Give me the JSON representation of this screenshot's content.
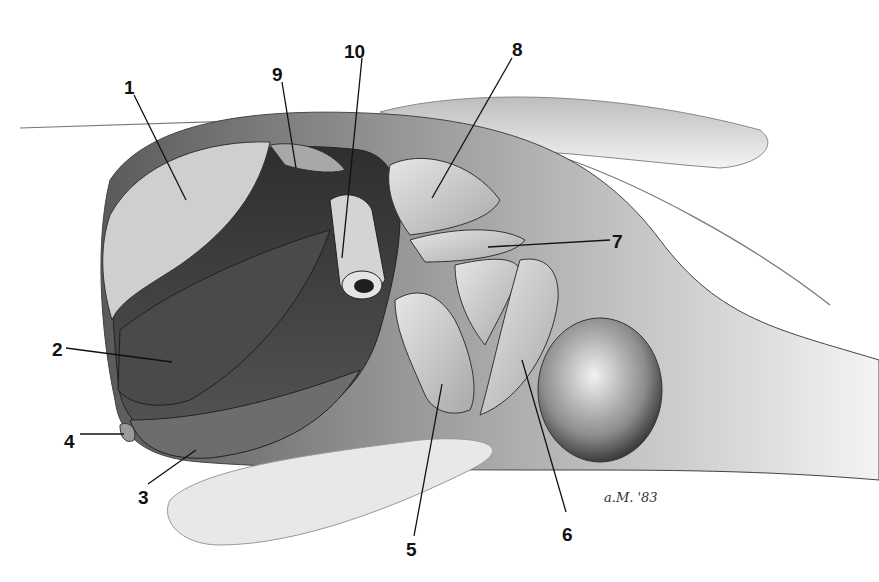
{
  "figure": {
    "type": "anatomical-illustration",
    "signature": "a.M. '83",
    "colors": {
      "background": "#ffffff",
      "ink": "#111111",
      "shade_dark": "#3a3a3a",
      "shade_mid": "#8a8a8a",
      "shade_light": "#d8d8d8"
    }
  },
  "labels": [
    {
      "id": "1",
      "text": "1",
      "x": 124,
      "y": 78,
      "line": [
        134,
        95,
        186,
        200
      ]
    },
    {
      "id": "2",
      "text": "2",
      "x": 52,
      "y": 340,
      "line": [
        66,
        348,
        172,
        362
      ]
    },
    {
      "id": "3",
      "text": "3",
      "x": 138,
      "y": 488,
      "line": [
        148,
        484,
        196,
        450
      ]
    },
    {
      "id": "4",
      "text": "4",
      "x": 64,
      "y": 432,
      "line": [
        80,
        434,
        124,
        434
      ]
    },
    {
      "id": "5",
      "text": "5",
      "x": 406,
      "y": 540,
      "line": [
        414,
        536,
        442,
        384
      ]
    },
    {
      "id": "6",
      "text": "6",
      "x": 562,
      "y": 525,
      "line": [
        566,
        512,
        522,
        360
      ]
    },
    {
      "id": "7",
      "text": "7",
      "x": 612,
      "y": 232,
      "line": [
        610,
        240,
        488,
        247
      ]
    },
    {
      "id": "8",
      "text": "8",
      "x": 512,
      "y": 40,
      "line": [
        512,
        58,
        432,
        198
      ]
    },
    {
      "id": "9",
      "text": "9",
      "x": 272,
      "y": 65,
      "line": [
        282,
        82,
        296,
        168
      ]
    },
    {
      "id": "10",
      "text": "10",
      "x": 344,
      "y": 42,
      "line": [
        362,
        58,
        342,
        258
      ]
    }
  ]
}
